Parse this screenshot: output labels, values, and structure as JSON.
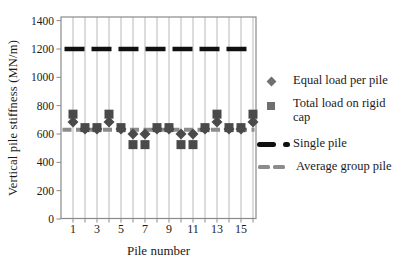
{
  "chart_data": {
    "type": "scatter",
    "title": "",
    "xlabel": "Pile number",
    "ylabel": "Vertical pile stiffness (MN/m)",
    "x": [
      1,
      2,
      3,
      4,
      5,
      6,
      7,
      8,
      9,
      10,
      11,
      12,
      13,
      14,
      15,
      16
    ],
    "x_tick_labels": [
      1,
      3,
      5,
      7,
      9,
      11,
      13,
      15
    ],
    "ylim": [
      0,
      1400
    ],
    "y_ticks": [
      0,
      200,
      400,
      600,
      800,
      1000,
      1200,
      1400
    ],
    "grid": "vertical-only",
    "legend_position": "right",
    "series": [
      {
        "name": "Equal load per pile",
        "kind": "scatter",
        "marker": "diamond",
        "color": "#4a4a4a",
        "values": [
          685,
          635,
          635,
          685,
          635,
          600,
          600,
          635,
          635,
          600,
          600,
          635,
          685,
          635,
          635,
          685
        ]
      },
      {
        "name": "Total load on rigid cap",
        "kind": "scatter",
        "marker": "square",
        "color": "#4a4a4a",
        "values": [
          740,
          645,
          645,
          740,
          645,
          525,
          525,
          645,
          645,
          525,
          525,
          645,
          740,
          645,
          645,
          740
        ]
      },
      {
        "name": "Single pile",
        "kind": "hline",
        "value": 1200,
        "color": "#101010",
        "style": "long-dash"
      },
      {
        "name": "Average group pile",
        "kind": "hline",
        "value": 630,
        "color": "#8c8c8c",
        "style": "short-dash"
      }
    ]
  },
  "legend": {
    "items": [
      {
        "label": "Equal load per pile",
        "marker": "diamond"
      },
      {
        "label": "Total load on rigid cap",
        "marker": "square"
      },
      {
        "label": "Single pile",
        "marker": "dash-dot"
      },
      {
        "label": "Average group pile",
        "marker": "double-dash"
      }
    ]
  },
  "colors": {
    "grid": "#b8b8b8",
    "border": "#8a8a8a",
    "text": "#1a1a1a",
    "marker": "#4a4a4a",
    "single_pile": "#101010",
    "average_group": "#8c8c8c",
    "legend_marker": "#6f6f6f"
  }
}
